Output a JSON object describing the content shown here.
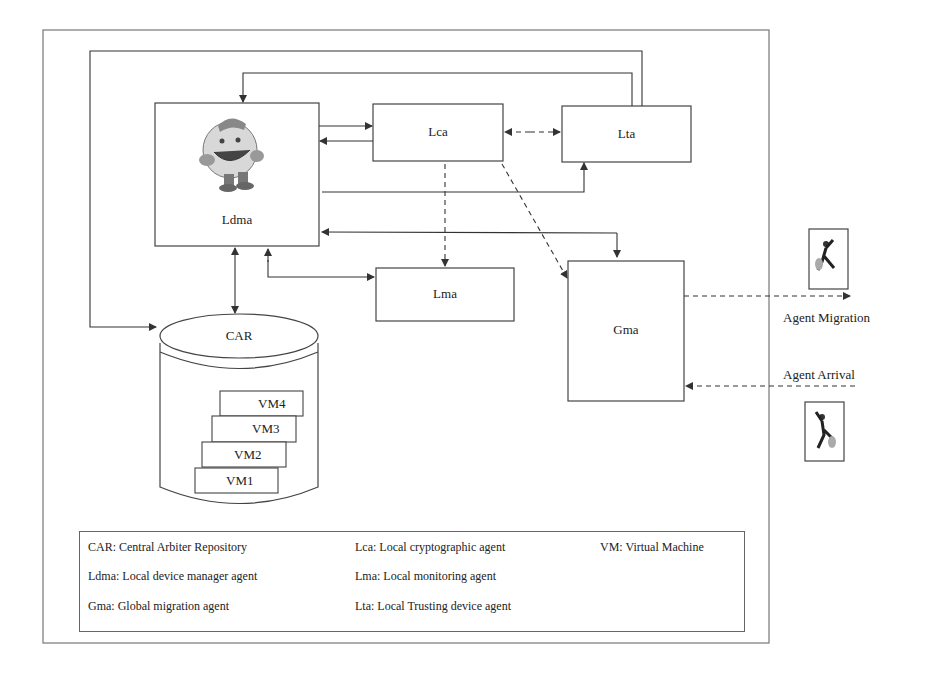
{
  "diagram": {
    "boxes": {
      "ldma": {
        "label": "Ldma"
      },
      "lca": {
        "label": "Lca"
      },
      "lta": {
        "label": "Lta"
      },
      "lma": {
        "label": "Lma"
      },
      "gma": {
        "label": "Gma"
      },
      "car": {
        "label": "CAR"
      }
    },
    "vms": [
      "VM4",
      "VM3",
      "VM2",
      "VM1"
    ],
    "external": {
      "migration_label": "Agent Migration",
      "arrival_label": "Agent Arrival"
    },
    "icons": {
      "mascot": "cartoon-agent-mascot-icon",
      "migrating_agent": "running-agent-icon",
      "arriving_agent": "running-agent-icon"
    },
    "colors": {
      "line": "#333333",
      "border": "#666666",
      "background": "#ffffff"
    }
  },
  "legend": {
    "items": [
      {
        "text": "CAR: Central Arbiter Repository"
      },
      {
        "text": "Lca: Local cryptographic agent"
      },
      {
        "text": "VM: Virtual Machine"
      },
      {
        "text": "Ldma: Local device manager agent"
      },
      {
        "text": "Lma: Local monitoring agent"
      },
      {
        "text": "Gma: Global migration agent"
      },
      {
        "text": "Lta: Local Trusting device agent"
      }
    ]
  }
}
